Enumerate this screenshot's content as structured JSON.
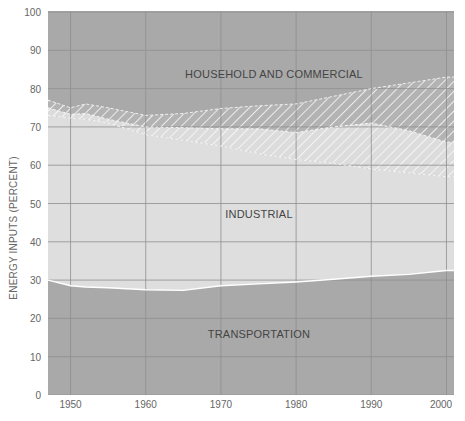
{
  "chart_data": {
    "type": "area",
    "title": "",
    "xlabel": "",
    "ylabel": "ENERGY INPUTS (PERCENT)",
    "xlim": [
      1947,
      2001
    ],
    "ylim": [
      0,
      100
    ],
    "x_ticks": [
      1950,
      1960,
      1970,
      1980,
      1990,
      2000
    ],
    "y_ticks": [
      0,
      10,
      20,
      30,
      40,
      50,
      60,
      70,
      80,
      90,
      100
    ],
    "grid": true,
    "x": [
      1947,
      1950,
      1952,
      1955,
      1960,
      1965,
      1970,
      1975,
      1980,
      1985,
      1990,
      1995,
      2000
    ],
    "boundaries": [
      {
        "name": "Transportation (top)",
        "values": [
          30,
          28.5,
          28.2,
          28,
          27.5,
          27.3,
          28.5,
          29,
          29.5,
          30.2,
          31,
          31.5,
          32.5
        ]
      },
      {
        "name": "Industrial solid (top)",
        "values": [
          73,
          72.3,
          72,
          71,
          68,
          66.5,
          65,
          63,
          61.5,
          60.5,
          59,
          58,
          57
        ]
      },
      {
        "name": "Lower hatched band (top)",
        "values": [
          75,
          73.3,
          73.5,
          72,
          70,
          69.8,
          69.5,
          69.5,
          68.5,
          70,
          71,
          69,
          66
        ]
      },
      {
        "name": "Upper hatched band (top)",
        "values": [
          77,
          75,
          76,
          75,
          73,
          73.5,
          74.8,
          75.5,
          76,
          78,
          80,
          81.5,
          83
        ]
      }
    ],
    "series": [
      {
        "name": "TRANSPORTATION",
        "values": [
          30,
          28.5,
          28.2,
          28,
          27.5,
          27.3,
          28.5,
          29,
          29.5,
          30.2,
          31,
          31.5,
          32.5
        ]
      },
      {
        "name": "INDUSTRIAL",
        "values": [
          43,
          43.8,
          43.8,
          43,
          40.5,
          39.2,
          36.5,
          34,
          32,
          30.3,
          28,
          26.5,
          24.5
        ]
      },
      {
        "name": "HOUSEHOLD AND COMMERCIAL",
        "values": [
          27,
          27.7,
          28,
          29,
          32,
          33.5,
          35,
          37,
          38.5,
          39.5,
          41,
          42,
          43
        ]
      }
    ],
    "annotations": [
      {
        "text": "HOUSEHOLD AND COMMERCIAL",
        "x": 1980,
        "y": 86
      },
      {
        "text": "INDUSTRIAL",
        "x": 1970.5,
        "y": 48
      },
      {
        "text": "TRANSPORTATION",
        "x": 1970.5,
        "y": 16
      }
    ],
    "colors": {
      "dark_region": "#a9a9a9",
      "light_region": "#dedede",
      "grid": "#8f8f8f",
      "hatch": "#ffffff",
      "boundary": "#ffffff"
    }
  },
  "labels": {
    "ylabel": "ENERGY INPUTS (PERCENT)",
    "household": "HOUSEHOLD AND COMMERCIAL",
    "industrial": "INDUSTRIAL",
    "transportation": "TRANSPORTATION",
    "x_ticks": [
      "1950",
      "1960",
      "1970",
      "1980",
      "1990",
      "2000"
    ],
    "y_ticks": [
      "0",
      "10",
      "20",
      "30",
      "40",
      "50",
      "60",
      "70",
      "80",
      "90",
      "100"
    ]
  }
}
